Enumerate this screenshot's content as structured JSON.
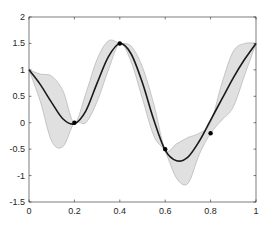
{
  "chart_data": {
    "type": "line",
    "title": "",
    "xlabel": "",
    "ylabel": "",
    "xlim": [
      0,
      1
    ],
    "ylim": [
      -1.5,
      2
    ],
    "grid": false,
    "x_ticks": [
      "0",
      "0.2",
      "0.4",
      "0.6",
      "0.8",
      "1"
    ],
    "y_ticks": [
      "-1.5",
      "-1",
      "-0.5",
      "0",
      "0.5",
      "1",
      "1.5",
      "2"
    ],
    "series": [
      {
        "name": "mean",
        "style": "solid black line",
        "x": [
          0,
          0.05,
          0.1,
          0.15,
          0.2,
          0.25,
          0.3,
          0.35,
          0.4,
          0.45,
          0.5,
          0.55,
          0.6,
          0.65,
          0.7,
          0.75,
          0.8,
          0.85,
          0.9,
          0.95,
          1.0
        ],
        "y": [
          1.0,
          0.72,
          0.38,
          0.07,
          -0.02,
          0.22,
          0.75,
          1.25,
          1.5,
          1.3,
          0.75,
          0.05,
          -0.52,
          -0.72,
          -0.65,
          -0.35,
          0.05,
          0.45,
          0.85,
          1.2,
          1.5
        ]
      },
      {
        "name": "confidence band upper",
        "style": "light gray fill",
        "x": [
          0,
          0.05,
          0.1,
          0.15,
          0.2,
          0.25,
          0.3,
          0.35,
          0.4,
          0.45,
          0.5,
          0.55,
          0.6,
          0.65,
          0.7,
          0.75,
          0.8,
          0.85,
          0.9,
          0.95,
          1.0
        ],
        "y": [
          1.0,
          0.92,
          0.88,
          0.6,
          0.0,
          0.55,
          1.2,
          1.55,
          1.5,
          1.45,
          1.05,
          0.35,
          -0.5,
          -0.4,
          -0.28,
          -0.2,
          0.0,
          0.75,
          1.35,
          1.5,
          1.5
        ]
      },
      {
        "name": "confidence band lower",
        "style": "light gray fill",
        "x": [
          0,
          0.05,
          0.1,
          0.15,
          0.2,
          0.25,
          0.3,
          0.35,
          0.4,
          0.45,
          0.5,
          0.55,
          0.6,
          0.65,
          0.7,
          0.75,
          0.8,
          0.85,
          0.9,
          0.95,
          1.0
        ],
        "y": [
          1.0,
          0.4,
          -0.35,
          -0.45,
          0.0,
          0.0,
          0.4,
          1.0,
          1.5,
          1.15,
          0.45,
          -0.25,
          -0.55,
          -1.05,
          -1.15,
          -0.6,
          -0.2,
          0.05,
          0.3,
          0.9,
          1.5
        ]
      },
      {
        "name": "observations",
        "style": "black dot markers",
        "x": [
          0.2,
          0.4,
          0.6,
          0.8
        ],
        "y": [
          0.0,
          1.5,
          -0.5,
          -0.2
        ]
      }
    ],
    "colors": {
      "line": "#1a1a1a",
      "band": "#e0e0e0",
      "band_edge": "#a8a8a8",
      "axis": "#262626"
    }
  }
}
